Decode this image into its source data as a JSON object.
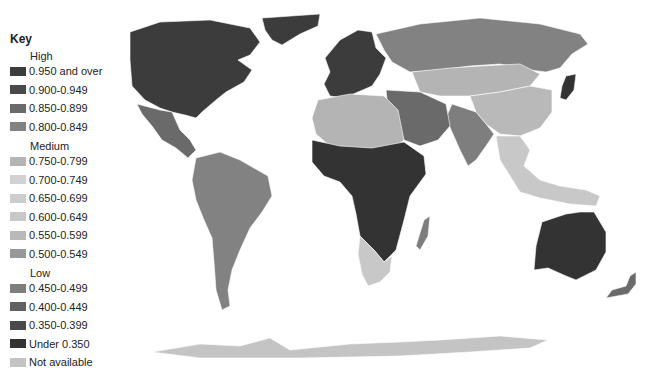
{
  "legend": {
    "title": "Key",
    "groups": [
      {
        "label": "High",
        "items": [
          {
            "label": "0.950 and over",
            "color": "#3c3c3c"
          },
          {
            "label": "0.900-0.949",
            "color": "#4a4a4a"
          },
          {
            "label": "0.850-0.899",
            "color": "#6a6a6a"
          },
          {
            "label": "0.800-0.849",
            "color": "#828282"
          }
        ]
      },
      {
        "label": "Medium",
        "items": [
          {
            "label": "0.750-0.799",
            "color": "#b4b4b4"
          },
          {
            "label": "0.700-0.749",
            "color": "#d2d2d2"
          },
          {
            "label": "0.650-0.699",
            "color": "#cdcdcd"
          },
          {
            "label": "0.600-0.649",
            "color": "#c8c8c8"
          },
          {
            "label": "0.550-0.599",
            "color": "#b9b9b9"
          },
          {
            "label": "0.500-0.549",
            "color": "#989898"
          }
        ]
      },
      {
        "label": "Low",
        "items": [
          {
            "label": "0.450-0.499",
            "color": "#7e7e7e"
          },
          {
            "label": "0.400-0.449",
            "color": "#606060"
          },
          {
            "label": "0.350-0.399",
            "color": "#4a4a4a"
          },
          {
            "label": "Under 0.350",
            "color": "#333333"
          },
          {
            "label": "Not available",
            "color": "#c4c4c4"
          }
        ]
      }
    ]
  },
  "map": {
    "regions": [
      {
        "name": "north-america",
        "color": "#3c3c3c"
      },
      {
        "name": "greenland",
        "color": "#3c3c3c"
      },
      {
        "name": "mexico-central-america",
        "color": "#6a6a6a"
      },
      {
        "name": "south-america",
        "color": "#828282"
      },
      {
        "name": "europe",
        "color": "#3c3c3c"
      },
      {
        "name": "russia",
        "color": "#828282"
      },
      {
        "name": "central-asia",
        "color": "#b4b4b4"
      },
      {
        "name": "china",
        "color": "#b9b9b9"
      },
      {
        "name": "india",
        "color": "#7e7e7e"
      },
      {
        "name": "middle-east",
        "color": "#6a6a6a"
      },
      {
        "name": "north-africa",
        "color": "#b4b4b4"
      },
      {
        "name": "sub-saharan-africa",
        "color": "#333333"
      },
      {
        "name": "southern-africa",
        "color": "#c8c8c8"
      },
      {
        "name": "madagascar",
        "color": "#7e7e7e"
      },
      {
        "name": "southeast-asia",
        "color": "#c8c8c8"
      },
      {
        "name": "japan",
        "color": "#333333"
      },
      {
        "name": "australia",
        "color": "#333333"
      },
      {
        "name": "new-zealand",
        "color": "#6a6a6a"
      },
      {
        "name": "antarctica",
        "color": "#c4c4c4"
      }
    ]
  }
}
